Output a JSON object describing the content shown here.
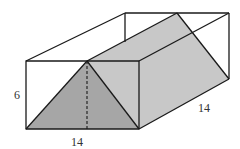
{
  "diagram": {
    "type": "3d-prism-in-box",
    "colors": {
      "front_triangle": "#a6a6a6",
      "slanted_face": "#c8c8c8",
      "background": "#ffffff",
      "edges": "#1a1a1a"
    },
    "labels": {
      "height": "6",
      "width": "14",
      "depth": "14"
    }
  }
}
